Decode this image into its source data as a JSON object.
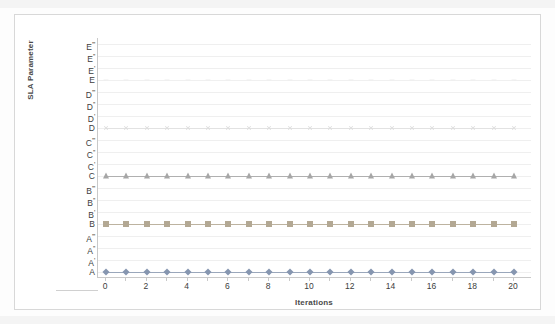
{
  "chart_data": {
    "type": "line",
    "title": "",
    "xlabel": "Iterations",
    "ylabel": "SLA Parameter",
    "grid": true,
    "legend": "none",
    "xlim": [
      0,
      20
    ],
    "x_tick_step": 2,
    "x_ticks": [
      0,
      2,
      4,
      6,
      8,
      10,
      12,
      14,
      16,
      18,
      20
    ],
    "x": [
      0,
      1,
      2,
      3,
      4,
      5,
      6,
      7,
      8,
      9,
      10,
      11,
      12,
      13,
      14,
      15,
      16,
      17,
      18,
      19,
      20
    ],
    "y_categories": [
      "A",
      "A'",
      "A''",
      "A'''",
      "B",
      "B'",
      "B''",
      "B'''",
      "C",
      "C'",
      "C''",
      "C'''",
      "D",
      "D'",
      "D''",
      "D'''",
      "E",
      "E'",
      "E''",
      "E'''"
    ],
    "series": [
      {
        "name": "Series A",
        "marker": "diamond",
        "color": "#8696b0",
        "line_color": "#9aa7bb",
        "y_category": "A",
        "values": [
          "A",
          "A",
          "A",
          "A",
          "A",
          "A",
          "A",
          "A",
          "A",
          "A",
          "A",
          "A",
          "A",
          "A",
          "A",
          "A",
          "A",
          "A",
          "A",
          "A",
          "A"
        ]
      },
      {
        "name": "Series B",
        "marker": "square",
        "color": "#b3a893",
        "line_color": "#bdb3a0",
        "y_category": "B",
        "values": [
          "B",
          "B",
          "B",
          "B",
          "B",
          "B",
          "B",
          "B",
          "B",
          "B",
          "B",
          "B",
          "B",
          "B",
          "B",
          "B",
          "B",
          "B",
          "B",
          "B",
          "B"
        ]
      },
      {
        "name": "Series C",
        "marker": "triangle",
        "color": "#a6a6a6",
        "line_color": "#b0b0b0",
        "y_category": "C",
        "values": [
          "C",
          "C",
          "C",
          "C",
          "C",
          "C",
          "C",
          "C",
          "C",
          "C",
          "C",
          "C",
          "C",
          "C",
          "C",
          "C",
          "C",
          "C",
          "C",
          "C",
          "C"
        ]
      },
      {
        "name": "Series D",
        "marker": "cross",
        "color": "#dedede",
        "line_color": "#e2e2e2",
        "y_category": "D",
        "values": [
          "D",
          "D",
          "D",
          "D",
          "D",
          "D",
          "D",
          "D",
          "D",
          "D",
          "D",
          "D",
          "D",
          "D",
          "D",
          "D",
          "D",
          "D",
          "D",
          "D",
          "D"
        ]
      },
      {
        "name": "Series E",
        "marker": "dash",
        "color": "#ededed",
        "line_color": "#f0f0f0",
        "y_category": "E",
        "values": [
          "E",
          "E",
          "E",
          "E",
          "E",
          "E",
          "E",
          "E",
          "E",
          "E",
          "E",
          "E",
          "E",
          "E",
          "E",
          "E",
          "E",
          "E",
          "E",
          "E",
          "E"
        ]
      }
    ],
    "colors": {
      "grid": "#efefef",
      "axis": "#c9c9c9",
      "frame": "#d8d8d8",
      "text": "#3d3d3d",
      "title_text": "#4a4a4a"
    }
  }
}
